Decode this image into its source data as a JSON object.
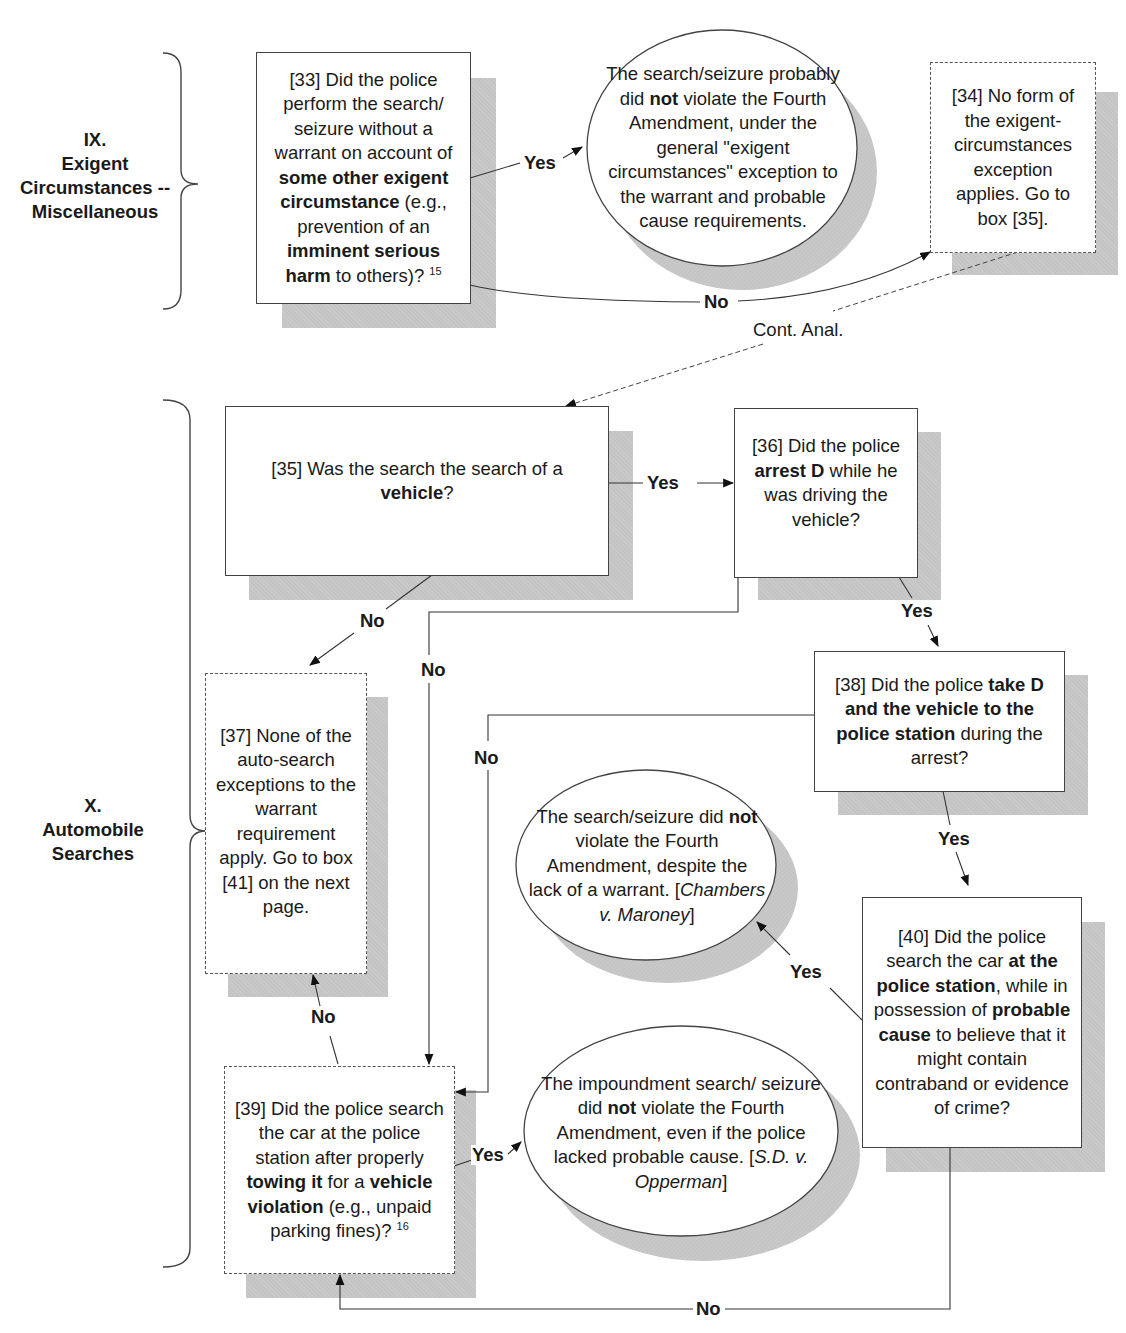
{
  "page_header_fragment": "\" ... ]",
  "sections": {
    "ix": {
      "number": "IX.",
      "title_line1": "Exigent",
      "title_line2": "Circumstances --",
      "title_line3": "Miscellaneous"
    },
    "x": {
      "number": "X.",
      "title_line1": "Automobile",
      "title_line2": "Searches"
    }
  },
  "nodes": {
    "box33": {
      "id": "[33]",
      "t1": "[33] Did the police perform the search/ seizure without a warrant on account of ",
      "b1": "some other exigent circumstance",
      "t2": " (e.g., prevention of an ",
      "b2": "imminent serious harm",
      "t3": " to others)? ",
      "footnote": "15"
    },
    "oval_exigent": {
      "t1": "The search/seizure probably did ",
      "b1": "not",
      "t2": " violate the Fourth Amendment, under the general \"exigent circumstances\" exception to the warrant and probable cause requirements."
    },
    "box34": {
      "text": "[34] No form of the exigent-circumstances exception applies. Go to box [35]."
    },
    "box35": {
      "t1": "[35] Was the search the search of a ",
      "b1": "vehicle",
      "t2": "?"
    },
    "box36": {
      "t1": "[36] Did the police ",
      "b1": "arrest D",
      "t2": " while he was driving the vehicle?"
    },
    "box37": {
      "text": "[37] None of the auto-search exceptions to the warrant requirement apply. Go to box [41] on the next page."
    },
    "box38": {
      "t1": "[38] Did the police ",
      "b1": "take D and the vehicle to the police station",
      "t2": " during the arrest?"
    },
    "oval_chambers": {
      "t1": "The search/seizure did ",
      "b1": "not",
      "t2": " violate the Fourth Amendment, despite the lack of a warrant. [",
      "case": "Chambers v. Maroney",
      "t3": "]"
    },
    "box40": {
      "t1": "[40] Did the police search the car ",
      "b1": "at the police station",
      "t2": ", while in possession of ",
      "b2": "probable cause",
      "t3": " to believe that it might contain contraband or evidence of crime?"
    },
    "box39": {
      "t1": "[39] Did the police search the car at the police station after properly ",
      "b1": "towing it",
      "t2": " for a ",
      "b2": "vehicle violation",
      "t3": " (e.g., unpaid parking fines)? ",
      "footnote": "16"
    },
    "oval_opperman": {
      "t1": "The impoundment search/ seizure did ",
      "b1": "not",
      "t2": " violate the Fourth Amendment, even if the police lacked probable cause. [",
      "case": "S.D. v. Opperman",
      "t3": "]"
    }
  },
  "edges": {
    "e33_yes": "Yes",
    "e33_no": "No",
    "e34_cont": "Cont. Anal.",
    "e35_yes": "Yes",
    "e35_no": "No",
    "e36_yes": "Yes",
    "e36_no": "No",
    "e38_no": "No",
    "e38_yes": "Yes",
    "e40_yes": "Yes",
    "e40_no": "No",
    "e39_yes": "Yes",
    "e39_no": "No"
  },
  "colors": {
    "line": "#333333",
    "shadow": "#c4c4c4",
    "box_fill": "#ffffff"
  }
}
